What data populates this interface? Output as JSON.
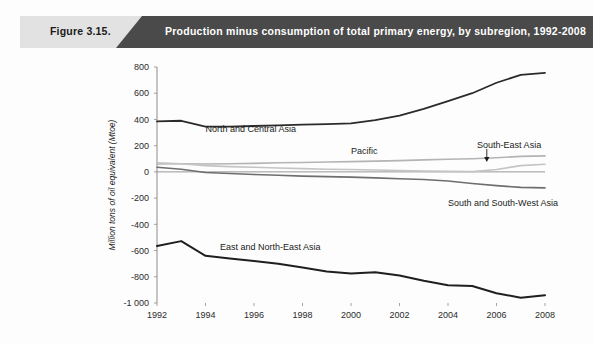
{
  "banner": {
    "figure_label": "Figure 3.15.",
    "title": "Production minus consumption of total primary energy, by subregion, 1992-2008",
    "light_color": "#e2e2e2",
    "dark_color": "#4a4a4a",
    "title_color": "#ffffff"
  },
  "chart_data": {
    "type": "line",
    "title": "Production minus consumption of total primary energy, by subregion, 1992-2008",
    "xlabel": "",
    "ylabel": "Million tons of oil equivalent (Mtoe)",
    "x": [
      1992,
      1993,
      1994,
      1995,
      1996,
      1997,
      1998,
      1999,
      2000,
      2001,
      2002,
      2003,
      2004,
      2005,
      2006,
      2007,
      2008
    ],
    "xtick_labels": [
      "1992",
      "1994",
      "1996",
      "1998",
      "2000",
      "2002",
      "2004",
      "2006",
      "2008"
    ],
    "xticks": [
      1992,
      1994,
      1996,
      1998,
      2000,
      2002,
      2004,
      2006,
      2008
    ],
    "ytick_labels": [
      "800",
      "600",
      "400",
      "200",
      "0",
      "-200",
      "-400",
      "-600",
      "-800",
      "-1 000"
    ],
    "yticks": [
      800,
      600,
      400,
      200,
      0,
      -200,
      -400,
      -600,
      -800,
      -1000
    ],
    "ylim": [
      -1000,
      800
    ],
    "xlim": [
      1992,
      2008
    ],
    "grid": false,
    "legend_position": "inline-labels",
    "series": [
      {
        "name": "North and Central Asia",
        "color": "#2b2b2b",
        "width": 1.8,
        "label_x": 1994.0,
        "label_y": 330,
        "values": [
          385,
          390,
          345,
          345,
          350,
          355,
          360,
          365,
          370,
          395,
          430,
          480,
          540,
          600,
          680,
          740,
          755
        ]
      },
      {
        "name": "Pacific",
        "color": "#b4b4b4",
        "width": 1.6,
        "label_x": 2000.0,
        "label_y": 160,
        "values": [
          60,
          62,
          60,
          62,
          65,
          70,
          72,
          75,
          78,
          82,
          86,
          92,
          96,
          100,
          108,
          118,
          122
        ]
      },
      {
        "name": "South-East Asia",
        "color": "#c4c4c4",
        "width": 1.6,
        "label_x": 2005.2,
        "label_y": 205,
        "arrow_from_y": 175,
        "arrow_to_y": 75,
        "arrow_x": 2005.6,
        "values": [
          70,
          62,
          48,
          40,
          35,
          30,
          25,
          20,
          18,
          14,
          10,
          6,
          4,
          2,
          18,
          48,
          58
        ]
      },
      {
        "name": "South and South-West Asia",
        "color": "#6e6e6e",
        "width": 1.6,
        "label_x": 2004.0,
        "label_y": -240,
        "values": [
          35,
          20,
          -5,
          -12,
          -20,
          -26,
          -32,
          -36,
          -40,
          -46,
          -52,
          -58,
          -70,
          -88,
          -105,
          -118,
          -122
        ]
      },
      {
        "name": "East and North-East Asia",
        "color": "#1f1f1f",
        "width": 2.0,
        "label_x": 1994.6,
        "label_y": -575,
        "values": [
          -565,
          -528,
          -640,
          -660,
          -680,
          -700,
          -730,
          -760,
          -775,
          -765,
          -790,
          -830,
          -865,
          -870,
          -925,
          -960,
          -940
        ]
      }
    ]
  }
}
